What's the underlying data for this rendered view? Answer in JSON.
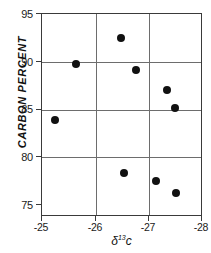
{
  "chart_data": {
    "type": "scatter",
    "title": "",
    "subtitle": "",
    "xlabel": "δ¹³c",
    "xlabel_base": "δ",
    "xlabel_sup": "13",
    "xlabel_tail": "c",
    "ylabel": "CARBON  PERCENT",
    "xlim": [
      -25,
      -28
    ],
    "ylim": [
      75,
      95
    ],
    "x_ticks": [
      -25,
      -26,
      -27,
      -28
    ],
    "x_tick_labels": [
      "-25",
      "-26",
      "-27",
      "-28"
    ],
    "y_ticks": [
      75,
      80,
      85,
      90,
      95
    ],
    "y_tick_labels": [
      "75",
      "80",
      "85",
      "90",
      "95"
    ],
    "x_axis_inverted": true,
    "grid": true,
    "grid_axes": "both",
    "legend": false,
    "legend_position": "none",
    "marker": "filled-circle",
    "marker_color": "#111111",
    "marker_size_px": 8,
    "frame_color": "#3a3a3a",
    "grid_color": "#6d6d6d",
    "background_color": "#ffffff",
    "n_points": 9,
    "points": [
      {
        "x": -25.24,
        "y": 84.5
      },
      {
        "x": -25.64,
        "y": 90.0
      },
      {
        "x": -26.49,
        "y": 92.6
      },
      {
        "x": -26.77,
        "y": 89.4
      },
      {
        "x": -27.36,
        "y": 87.4
      },
      {
        "x": -27.5,
        "y": 85.6
      },
      {
        "x": -26.55,
        "y": 79.2
      },
      {
        "x": -27.16,
        "y": 78.4
      },
      {
        "x": -27.52,
        "y": 77.2
      }
    ],
    "series": [
      {
        "name": "samples",
        "x": [
          -25.24,
          -25.64,
          -26.49,
          -26.77,
          -27.36,
          -27.5,
          -26.55,
          -27.16,
          -27.52
        ],
        "values": [
          84.5,
          90.0,
          92.6,
          89.4,
          87.4,
          85.6,
          79.2,
          78.4,
          77.2
        ]
      }
    ]
  }
}
